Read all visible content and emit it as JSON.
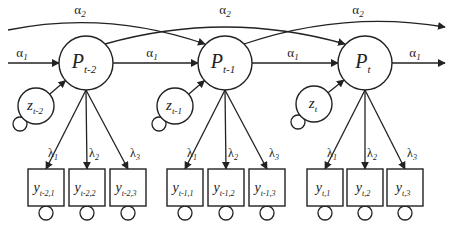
{
  "diagram": {
    "type": "structural-equation-model",
    "colors": {
      "stroke": "#222222",
      "background": "#ffffff"
    },
    "latent_nodes": [
      {
        "id": "P_t-2",
        "symbol": "P",
        "subscript": "t-2",
        "cx": 86,
        "cy": 63,
        "r": 27
      },
      {
        "id": "P_t-1",
        "symbol": "P",
        "subscript": "t-1",
        "cx": 225,
        "cy": 63,
        "r": 27
      },
      {
        "id": "P_t",
        "symbol": "P",
        "subscript": "t",
        "cx": 365,
        "cy": 63,
        "r": 27
      }
    ],
    "disturbance_nodes": [
      {
        "id": "z_t-2",
        "symbol": "z",
        "subscript": "t-2",
        "cx": 36,
        "cy": 106,
        "r": 18,
        "target": "P_t-2"
      },
      {
        "id": "z_t-1",
        "symbol": "z",
        "subscript": "t-1",
        "cx": 175,
        "cy": 106,
        "r": 18,
        "target": "P_t-1"
      },
      {
        "id": "z_t",
        "symbol": "z",
        "subscript": "t",
        "cx": 314,
        "cy": 104,
        "r": 18,
        "target": "P_t"
      }
    ],
    "indicator_nodes": [
      {
        "id": "y_t-2,1",
        "symbol": "y",
        "subscript": "t-2,1",
        "x": 28,
        "loading": "λ",
        "loading_sub": "1",
        "parent": "P_t-2"
      },
      {
        "id": "y_t-2,2",
        "symbol": "y",
        "subscript": "t-2,2",
        "x": 69,
        "loading": "λ",
        "loading_sub": "2",
        "parent": "P_t-2"
      },
      {
        "id": "y_t-2,3",
        "symbol": "y",
        "subscript": "t-2,3",
        "x": 110,
        "loading": "λ",
        "loading_sub": "3",
        "parent": "P_t-2"
      },
      {
        "id": "y_t-1,1",
        "symbol": "y",
        "subscript": "t-1,1",
        "x": 167,
        "loading": "λ",
        "loading_sub": "1",
        "parent": "P_t-1"
      },
      {
        "id": "y_t-1,2",
        "symbol": "y",
        "subscript": "t-1,2",
        "x": 208,
        "loading": "λ",
        "loading_sub": "2",
        "parent": "P_t-1"
      },
      {
        "id": "y_t-1,3",
        "symbol": "y",
        "subscript": "t-1,3",
        "x": 249,
        "loading": "λ",
        "loading_sub": "3",
        "parent": "P_t-1"
      },
      {
        "id": "y_t,1",
        "symbol": "y",
        "subscript": "t,1",
        "x": 307,
        "loading": "λ",
        "loading_sub": "1",
        "parent": "P_t"
      },
      {
        "id": "y_t,2",
        "symbol": "y",
        "subscript": "t,2",
        "x": 347,
        "loading": "λ",
        "loading_sub": "2",
        "parent": "P_t"
      },
      {
        "id": "y_t,3",
        "symbol": "y",
        "subscript": "t,3",
        "x": 387,
        "loading": "λ",
        "loading_sub": "3",
        "parent": "P_t"
      }
    ],
    "indicator_box": {
      "y": 169,
      "width": 36,
      "height": 37
    },
    "paths": {
      "alpha1": {
        "symbol": "α",
        "subscript": "1"
      },
      "alpha2": {
        "symbol": "α",
        "subscript": "2"
      }
    },
    "alpha1_edges": [
      {
        "from": "input",
        "to": "P_t-2",
        "label_x": 22
      },
      {
        "from": "P_t-2",
        "to": "P_t-1",
        "label_x": 152
      },
      {
        "from": "P_t-1",
        "to": "P_t",
        "label_x": 293
      },
      {
        "from": "P_t",
        "to": "output",
        "label_x": 415
      }
    ],
    "alpha2_edges": [
      {
        "from": "input-lag2",
        "to": "P_t-1",
        "label_x": 80
      },
      {
        "from": "P_t-2",
        "to": "P_t",
        "label_x": 225
      },
      {
        "from": "P_t-1",
        "to": "output-lag2",
        "label_x": 358
      }
    ]
  }
}
